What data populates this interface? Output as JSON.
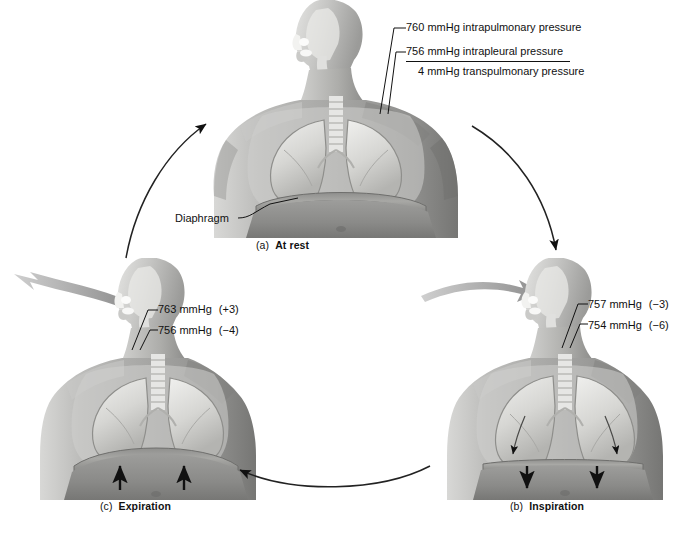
{
  "figure": {
    "type": "cycle-diagram"
  },
  "panels": [
    {
      "id": "at-rest",
      "tag": "(a)",
      "name": "At rest",
      "labels": [
        {
          "value": "760 mmHg",
          "text": "intrapulmonary pressure"
        },
        {
          "value": "756 mmHg",
          "text": "intrapleural pressure"
        },
        {
          "value": "4 mmHg",
          "text": "transpulmonary pressure"
        }
      ],
      "annotations": [
        {
          "text": "Diaphragm"
        }
      ]
    },
    {
      "id": "inspiration",
      "tag": "(b)",
      "name": "Inspiration",
      "labels": [
        {
          "value": "757 mmHg",
          "delta": "(−3)"
        },
        {
          "value": "754 mmHg",
          "delta": "(−6)"
        }
      ],
      "airflow": "in",
      "diaphragm_motion": "down"
    },
    {
      "id": "expiration",
      "tag": "(c)",
      "name": "Expiration",
      "labels": [
        {
          "value": "763 mmHg",
          "delta": "(+3)"
        },
        {
          "value": "756 mmHg",
          "delta": "(−4)"
        }
      ],
      "airflow": "out",
      "diaphragm_motion": "up"
    }
  ],
  "cycle_arrows": [
    {
      "id": "rest-to-inspiration",
      "from": "At rest",
      "to": "Inspiration",
      "direction": "clockwise"
    },
    {
      "id": "inspiration-to-expiration",
      "from": "Inspiration",
      "to": "Expiration",
      "direction": "clockwise"
    },
    {
      "id": "expiration-to-rest",
      "from": "Expiration",
      "to": "At rest",
      "direction": "clockwise"
    }
  ],
  "colors": {
    "ink": "#111111",
    "airflow_arrow": "#9a9a9a",
    "background": "#ffffff"
  }
}
